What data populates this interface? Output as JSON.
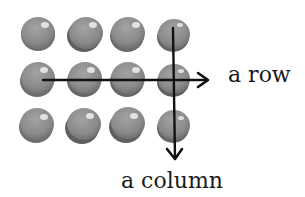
{
  "diagram": {
    "labels": {
      "row": "a row",
      "column": "a column"
    },
    "grid": {
      "rows": 3,
      "columns": 4,
      "ball_color": "#8c8c8c",
      "ball_shadow_color": "#6a6a6a",
      "ball_highlight_color": "#f2f2f2"
    },
    "arrows": {
      "row_arrow": {
        "direction": "right",
        "color": "#111111"
      },
      "column_arrow": {
        "direction": "down",
        "color": "#111111"
      }
    }
  }
}
